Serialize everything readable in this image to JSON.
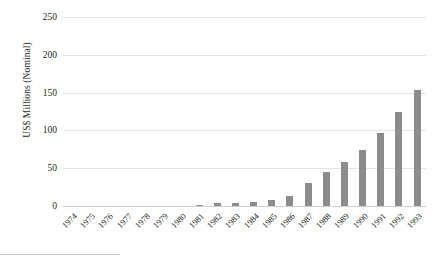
{
  "chart_data": {
    "type": "bar",
    "title": "",
    "xlabel": "",
    "ylabel": "US$ Millions (Nominal)",
    "ylim": [
      0,
      250
    ],
    "yticks": [
      0,
      50,
      100,
      150,
      200,
      250
    ],
    "ytick_labels": [
      "0",
      "50",
      "100",
      "150",
      "200",
      "250"
    ],
    "grid": true,
    "legend": false,
    "bar_color": "#8c8c8c",
    "categories": [
      "1974",
      "1975",
      "1976",
      "1977",
      "1978",
      "1979",
      "1980",
      "1981",
      "1982",
      "1983",
      "1984",
      "1985",
      "1986",
      "1987",
      "1988",
      "1989",
      "1990",
      "1991",
      "1992",
      "1993"
    ],
    "values": [
      0,
      0,
      0,
      0,
      0,
      0,
      0.5,
      2,
      4,
      4,
      5,
      8,
      13,
      30,
      45,
      58,
      74,
      97,
      124,
      153
    ],
    "values_note": "final plotted bar reaches approximately 198",
    "series": [
      {
        "name": "US$ Millions (Nominal)",
        "values": [
          0,
          0,
          0,
          0,
          0,
          0,
          0.5,
          2,
          4,
          4,
          5,
          8,
          13,
          30,
          45,
          58,
          74,
          97,
          124,
          153
        ]
      }
    ]
  },
  "axes": {
    "y_title": "US$ Millions (Nominal)"
  },
  "colors": {
    "bar": "#8c8c8c",
    "grid": "#e3e3e3",
    "text": "#231f20",
    "background": "#ffffff"
  }
}
